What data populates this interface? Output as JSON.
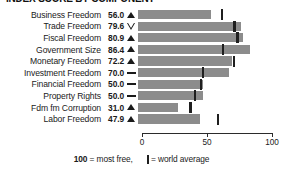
{
  "title": "INDEX SCORE BY COMPONENT",
  "axis": {
    "ticks": [
      0,
      50,
      100
    ],
    "min": 0,
    "max": 100
  },
  "footer": {
    "best_value": "100",
    "best_text": "= most free,",
    "legend_text": "= world average",
    "legend_icon": "world-average-tick-icon"
  },
  "colors": {
    "bar": "#8c8c8c",
    "marker": "#1f1f1f",
    "text": "#1a1a1a",
    "axis": "#2b2b2b"
  },
  "trend_glyphs": {
    "up": "triangle-up-filled-icon",
    "down": "triangle-down-hollow-icon",
    "flat": "dash-icon"
  },
  "chart_data": {
    "type": "bar",
    "orientation": "horizontal",
    "title": "INDEX SCORE BY COMPONENT",
    "xlabel": "",
    "ylabel": "",
    "xlim": [
      0,
      100
    ],
    "xticks": [
      0,
      50,
      100
    ],
    "grid": false,
    "legend": "100 = most free, | = world average",
    "categories": [
      "Business Freedom",
      "Trade Freedom",
      "Fiscal Freedom",
      "Government Size",
      "Monetary Freedom",
      "Investment Freedom",
      "Financial Freedom",
      "Property Rights",
      "Fdm fm Corruption",
      "Labor Freedom"
    ],
    "values": [
      56.0,
      79.6,
      80.9,
      86.4,
      72.2,
      70.0,
      50.0,
      50.0,
      31.0,
      47.9
    ],
    "value_labels": [
      "56.0",
      "79.6",
      "80.9",
      "86.4",
      "72.2",
      "70.0",
      "50.0",
      "50.0",
      "31.0",
      "47.9"
    ],
    "trends": [
      "up",
      "down",
      "up",
      "up",
      "up",
      "flat",
      "flat",
      "flat",
      "up",
      "up"
    ],
    "world_average": [
      64.3,
      74.2,
      76.4,
      65.2,
      74.0,
      50.1,
      48.5,
      43.8,
      40.3,
      61.5
    ],
    "series": [
      {
        "name": "Country score",
        "values": [
          56.0,
          79.6,
          80.9,
          86.4,
          72.2,
          70.0,
          50.0,
          50.0,
          31.0,
          47.9
        ]
      },
      {
        "name": "World average",
        "values": [
          64.3,
          74.2,
          76.4,
          65.2,
          74.0,
          50.1,
          48.5,
          43.8,
          40.3,
          61.5
        ]
      }
    ]
  }
}
